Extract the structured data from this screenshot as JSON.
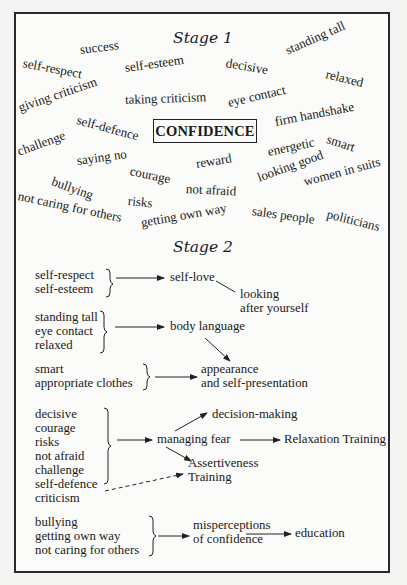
{
  "stage1": {
    "title": "Stage 1",
    "center": "CONFIDENCE",
    "words": [
      {
        "text": "success",
        "x": 80,
        "y": 42,
        "rot": -7
      },
      {
        "text": "self-respect",
        "x": 23,
        "y": 55,
        "rot": 11
      },
      {
        "text": "self-esteem",
        "x": 125,
        "y": 60,
        "rot": -8
      },
      {
        "text": "decisive",
        "x": 226,
        "y": 55,
        "rot": 10
      },
      {
        "text": "standing tall",
        "x": 286,
        "y": 43,
        "rot": -24
      },
      {
        "text": "relaxed",
        "x": 326,
        "y": 66,
        "rot": 14
      },
      {
        "text": "giving criticism",
        "x": 19,
        "y": 100,
        "rot": -19
      },
      {
        "text": "taking criticism",
        "x": 125,
        "y": 92,
        "rot": -2
      },
      {
        "text": "eye contact",
        "x": 228,
        "y": 95,
        "rot": -13
      },
      {
        "text": "self-defence",
        "x": 77,
        "y": 112,
        "rot": 15
      },
      {
        "text": "firm handshake",
        "x": 275,
        "y": 114,
        "rot": -11
      },
      {
        "text": "smart",
        "x": 327,
        "y": 131,
        "rot": 18
      },
      {
        "text": "challenge",
        "x": 18,
        "y": 144,
        "rot": -20
      },
      {
        "text": "saying no",
        "x": 77,
        "y": 153,
        "rot": -8
      },
      {
        "text": "energetic",
        "x": 268,
        "y": 144,
        "rot": -12
      },
      {
        "text": "reward",
        "x": 196,
        "y": 156,
        "rot": -9
      },
      {
        "text": "courage",
        "x": 130,
        "y": 163,
        "rot": 12
      },
      {
        "text": "bullying",
        "x": 52,
        "y": 173,
        "rot": 20
      },
      {
        "text": "looking good",
        "x": 258,
        "y": 170,
        "rot": -20
      },
      {
        "text": "women in suits",
        "x": 304,
        "y": 174,
        "rot": -15
      },
      {
        "text": "not afraid",
        "x": 186,
        "y": 181,
        "rot": 3
      },
      {
        "text": "not caring for others",
        "x": 18,
        "y": 188,
        "rot": 12
      },
      {
        "text": "risks",
        "x": 128,
        "y": 193,
        "rot": 6
      },
      {
        "text": "getting own way",
        "x": 141,
        "y": 215,
        "rot": -10
      },
      {
        "text": "sales people",
        "x": 252,
        "y": 203,
        "rot": 8
      },
      {
        "text": "politicians",
        "x": 327,
        "y": 206,
        "rot": 14
      }
    ]
  },
  "stage2": {
    "title": "Stage 2",
    "groups": [
      {
        "lines": [
          "self-respect",
          "self-esteem"
        ]
      },
      {
        "lines": [
          "standing tall",
          "eye contact",
          "relaxed"
        ]
      },
      {
        "lines": [
          "smart",
          "appropriate clothes"
        ]
      },
      {
        "lines": [
          "decisive",
          "courage",
          "risks",
          "not afraid",
          "challenge",
          "self-defence",
          "criticism"
        ]
      },
      {
        "lines": [
          "bullying",
          "getting own way",
          "not caring for others"
        ]
      }
    ],
    "outcomes": {
      "self_love": "self-love",
      "looking_after": [
        "looking",
        "after yourself"
      ],
      "body_language": "body language",
      "appearance": [
        "appearance",
        "and self-presentation"
      ],
      "decision_making": "decision-making",
      "managing_fear": "managing fear",
      "relaxation_training": "Relaxation Training",
      "assertiveness": [
        "Assertiveness",
        "Training"
      ],
      "misperceptions": [
        "misperceptions",
        "of confidence"
      ],
      "education": "education"
    }
  }
}
